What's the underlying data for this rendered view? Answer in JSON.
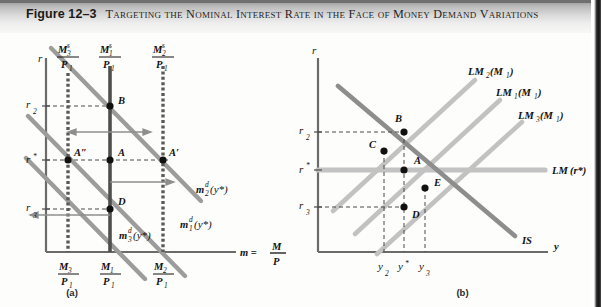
{
  "header": {
    "figure_number": "Figure 12–3",
    "title": "Targeting the Nominal Interest Rate in the Face of Money Demand Variations"
  },
  "panel_a": {
    "caption": "(a)",
    "y_axis_label": "r",
    "x_axis_label": "m =",
    "x_axis_label_num": "M",
    "x_axis_label_den": "P",
    "y_ticks": [
      {
        "name": "r2",
        "base": "r",
        "sub": "2",
        "sup": "",
        "y_px": 106
      },
      {
        "name": "r_star",
        "base": "r",
        "sub": "",
        "sup": "*",
        "y_px": 160
      },
      {
        "name": "r3",
        "base": "r",
        "sub": "3",
        "sup": "",
        "y_px": 209
      }
    ],
    "money_supply_lines": [
      {
        "name": "Ms3/P1",
        "num_base": "M",
        "num_sub": "3",
        "num_sup": "s",
        "den_base": "P",
        "den_sub": "1",
        "x_px": 68,
        "style": "dashed"
      },
      {
        "name": "Ms1/P1",
        "num_base": "M",
        "num_sub": "1",
        "num_sup": "s",
        "den_base": "P",
        "den_sub": "1",
        "x_px": 110,
        "style": "solid"
      },
      {
        "name": "Ms2/P1",
        "num_base": "M",
        "num_sub": "2",
        "num_sup": "s",
        "den_base": "P",
        "den_sub": "1",
        "x_px": 163,
        "style": "dashed"
      }
    ],
    "x_ticks": [
      {
        "name": "M3/P1",
        "num_base": "M",
        "num_sub": "3",
        "den_base": "P",
        "den_sub": "1",
        "x_px": 68
      },
      {
        "name": "M1/P1",
        "num_base": "M",
        "num_sub": "1",
        "den_base": "P",
        "den_sub": "1",
        "x_px": 110
      },
      {
        "name": "M2/P1",
        "num_base": "M",
        "num_sub": "2",
        "den_base": "P",
        "den_sub": "1",
        "x_px": 163
      }
    ],
    "demand_curves": [
      {
        "name": "md2",
        "base": "m",
        "sub": "2",
        "sup": "d",
        "arg": "(y*)",
        "label_x": 196,
        "label_y": 190
      },
      {
        "name": "md1",
        "base": "m",
        "sub": "1",
        "sup": "d",
        "arg": "(y*)",
        "label_x": 180,
        "label_y": 226
      },
      {
        "name": "md3",
        "base": "m",
        "sub": "3",
        "sup": "d",
        "arg": "(y*)",
        "label_x": 128,
        "label_y": 236
      }
    ],
    "points": [
      {
        "label": "B",
        "x_px": 110,
        "y_px": 106
      },
      {
        "label": "A",
        "x_px": 110,
        "y_px": 160
      },
      {
        "label": "A′",
        "x_px": 163,
        "y_px": 160
      },
      {
        "label": "A″",
        "x_px": 68,
        "y_px": 160
      },
      {
        "label": "D",
        "x_px": 110,
        "y_px": 209
      }
    ]
  },
  "panel_b": {
    "caption": "(b)",
    "y_axis_label": "r",
    "x_axis_label": "y",
    "y_ticks": [
      {
        "name": "r2",
        "base": "r",
        "sub": "2",
        "sup": "",
        "y_px": 132
      },
      {
        "name": "r_star",
        "base": "r",
        "sub": "",
        "sup": "*",
        "y_px": 170
      },
      {
        "name": "r3",
        "base": "r",
        "sub": "3",
        "sup": "",
        "y_px": 207
      }
    ],
    "x_ticks": [
      {
        "name": "y2",
        "base": "y",
        "sub": "2",
        "sup": "",
        "x_px": 384
      },
      {
        "name": "y_star",
        "base": "y",
        "sub": "",
        "sup": "*",
        "x_px": 404
      },
      {
        "name": "y3",
        "base": "y",
        "sub": "3",
        "sup": "",
        "x_px": 425
      }
    ],
    "curves": [
      {
        "name": "LM2(M1)",
        "base": "LM",
        "sub": "2",
        "arg": "(M",
        "arg_sub": "1",
        "arg_end": ")",
        "label_x": 468,
        "label_y": 73
      },
      {
        "name": "LM1(M1)",
        "base": "LM",
        "sub": "1",
        "arg": "(M",
        "arg_sub": "1",
        "arg_end": ")",
        "label_x": 496,
        "label_y": 95
      },
      {
        "name": "LM3(M1)",
        "base": "LM",
        "sub": "3",
        "arg": "(M",
        "arg_sub": "1",
        "arg_end": ")",
        "label_x": 517,
        "label_y": 118
      },
      {
        "name": "LM(r*)",
        "base": "LM",
        "sub": "",
        "arg": " (r*)",
        "arg_sub": "",
        "arg_end": "",
        "label_x": 500,
        "label_y": 173
      },
      {
        "name": "IS",
        "base": "IS",
        "sub": "",
        "arg": "",
        "arg_sub": "",
        "arg_end": "",
        "label_x": 487,
        "label_y": 243
      }
    ],
    "points": [
      {
        "label": "B",
        "x_px": 404,
        "y_px": 132
      },
      {
        "label": "C",
        "x_px": 384,
        "y_px": 151
      },
      {
        "label": "A",
        "x_px": 404,
        "y_px": 170
      },
      {
        "label": "E",
        "x_px": 425,
        "y_px": 188
      },
      {
        "label": "D",
        "x_px": 404,
        "y_px": 207
      }
    ]
  },
  "colors": {
    "axis": "#6b6b6b",
    "money_supply": "#5a5a5a",
    "demand_curve": "#9a9a9a",
    "lm_light": "#bdbdbd",
    "is_dark": "#8a8a8a",
    "dash": "#4a4a4a",
    "point": "#111111",
    "header_text": "#1a1a1a"
  }
}
